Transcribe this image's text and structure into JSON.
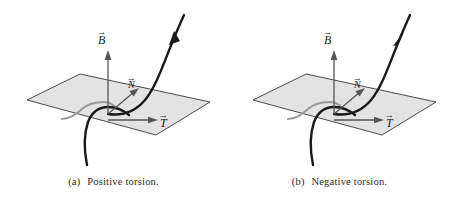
{
  "figure": {
    "width": 453,
    "height": 206,
    "background": "#ffffff"
  },
  "colors": {
    "plane_fill": "#e3e3e3",
    "plane_stroke": "#4a4a4a",
    "curve_dark": "#1a1a1a",
    "curve_hidden": "#9a9a9a",
    "vector_stroke": "#555555",
    "caption_text": "#2a2a2a"
  },
  "panels": [
    {
      "id": "a",
      "caption_tag": "(a)",
      "caption_text": "Positive torsion.",
      "curve_arrow_direction": "outward-up",
      "vectors": [
        {
          "name": "binormal",
          "label": "B",
          "accent": "→",
          "direction": "up"
        },
        {
          "name": "tangent",
          "label": "T",
          "accent": "→",
          "direction": "right"
        },
        {
          "name": "normal",
          "label": "N",
          "accent": "→",
          "direction": "up-right-diagonal"
        }
      ]
    },
    {
      "id": "b",
      "caption_tag": "(b)",
      "caption_text": "Negative torsion.",
      "curve_arrow_direction": "inward-down",
      "vectors": [
        {
          "name": "binormal",
          "label": "B",
          "accent": "→",
          "direction": "up"
        },
        {
          "name": "tangent",
          "label": "T",
          "accent": "→",
          "direction": "right"
        },
        {
          "name": "normal",
          "label": "N",
          "accent": "→",
          "direction": "up-right-diagonal"
        }
      ]
    }
  ]
}
